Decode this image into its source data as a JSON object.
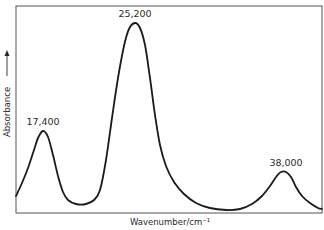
{
  "chart_data": {
    "type": "line",
    "title": "",
    "xlabel": "Wavenumber/cm⁻¹",
    "ylabel": "Absorbance",
    "ylabel_arrow": "→",
    "grid": false,
    "legend": null,
    "x_ticks": [],
    "y_ticks": [],
    "series": [
      {
        "name": "absorption spectrum",
        "points_px": [
          [
            16,
            196
          ],
          [
            22,
            183
          ],
          [
            28,
            168
          ],
          [
            34,
            150
          ],
          [
            38,
            138
          ],
          [
            43,
            131
          ],
          [
            48,
            137
          ],
          [
            53,
            155
          ],
          [
            58,
            176
          ],
          [
            63,
            192
          ],
          [
            68,
            200
          ],
          [
            76,
            204
          ],
          [
            86,
            204
          ],
          [
            94,
            200
          ],
          [
            100,
            190
          ],
          [
            106,
            160
          ],
          [
            112,
            118
          ],
          [
            118,
            78
          ],
          [
            124,
            46
          ],
          [
            129,
            29
          ],
          [
            135,
            23
          ],
          [
            140,
            28
          ],
          [
            145,
            45
          ],
          [
            150,
            78
          ],
          [
            155,
            115
          ],
          [
            160,
            145
          ],
          [
            166,
            166
          ],
          [
            174,
            182
          ],
          [
            184,
            194
          ],
          [
            196,
            203
          ],
          [
            210,
            208
          ],
          [
            226,
            210
          ],
          [
            240,
            209
          ],
          [
            252,
            204
          ],
          [
            262,
            196
          ],
          [
            270,
            186
          ],
          [
            276,
            177
          ],
          [
            281,
            172
          ],
          [
            286,
            172
          ],
          [
            291,
            177
          ],
          [
            296,
            187
          ],
          [
            302,
            196
          ],
          [
            310,
            203
          ],
          [
            318,
            208
          ],
          [
            322,
            209
          ]
        ]
      }
    ],
    "annotations": [
      {
        "text": "17,400",
        "x_px": 43,
        "y_px": 125,
        "value": 17400
      },
      {
        "text": "25,200",
        "x_px": 135,
        "y_px": 17,
        "value": 25200
      },
      {
        "text": "38,000",
        "x_px": 286,
        "y_px": 166,
        "value": 38000
      }
    ],
    "peaks": [
      {
        "wavenumber": 17400,
        "relative_absorbance": 0.43
      },
      {
        "wavenumber": 25200,
        "relative_absorbance": 1.0
      },
      {
        "wavenumber": 38000,
        "relative_absorbance": 0.22
      }
    ],
    "frame": {
      "left": 16,
      "top": 6,
      "right": 322,
      "bottom": 213
    }
  }
}
